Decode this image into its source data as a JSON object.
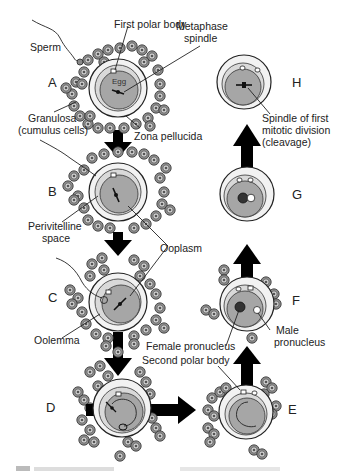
{
  "diagram": {
    "stages": [
      {
        "id": "A",
        "label": "A"
      },
      {
        "id": "B",
        "label": "B"
      },
      {
        "id": "C",
        "label": "C"
      },
      {
        "id": "D",
        "label": "D"
      },
      {
        "id": "E",
        "label": "E"
      },
      {
        "id": "F",
        "label": "F"
      },
      {
        "id": "G",
        "label": "G"
      },
      {
        "id": "H",
        "label": "H"
      }
    ],
    "labels": {
      "sperm": "Sperm",
      "first_polar_body": "First polar body",
      "metaphase_spindle_1": "Metaphase",
      "metaphase_spindle_2": "spindle",
      "egg": "Egg",
      "granulosa_1": "Granulosa",
      "granulosa_2": "(cumulus cells)",
      "zona_pellucida": "Zona pellucida",
      "perivitelline_1": "Perivitelline",
      "perivitelline_2": "space",
      "ooplasm": "Ooplasm",
      "oolemma": "Oolemma",
      "second_polar_body": "Second polar body",
      "female_pronucleus": "Female pronucleus",
      "male_pronucleus_1": "Male",
      "male_pronucleus_2": "pronucleus",
      "spindle_cleavage_1": "Spindle of first",
      "spindle_cleavage_2": "mitotic division",
      "spindle_cleavage_3": "(cleavage)"
    },
    "colors": {
      "zona": "#f2f2f2",
      "perivitelline": "#d9d9d9",
      "ooplasm": "#a6a6a6",
      "cumulus_cell": "#8a8a8a",
      "arrow": "#000000"
    }
  }
}
